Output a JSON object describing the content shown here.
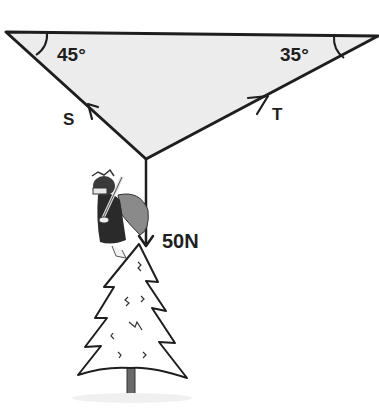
{
  "diagram": {
    "type": "force-diagram",
    "angles": {
      "left": "45°",
      "right": "35°"
    },
    "forces": {
      "left_tension": "S",
      "right_tension": "T",
      "weight": "50N"
    },
    "colors": {
      "stroke": "#1e1e1e",
      "fill": "#ececec",
      "trunk": "#6a6a6a"
    },
    "figures": [
      "angel-ornament",
      "christmas-tree"
    ]
  }
}
